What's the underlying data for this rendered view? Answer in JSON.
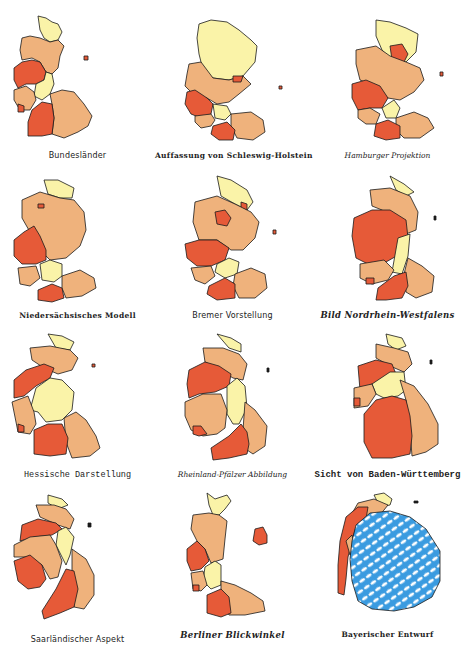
{
  "colors": {
    "light": "#faf3a8",
    "medium": "#efb27c",
    "dark": "#e65a38",
    "bavaria_blue": "#3a9be0",
    "outline": "#1a1a1a"
  },
  "panels": [
    {
      "caption": "Bundesländer",
      "style": "sans"
    },
    {
      "caption": "Auffassung von Schleswig-Holstein",
      "style": "fraktur"
    },
    {
      "caption": "Hamburger Projektion",
      "style": "script"
    },
    {
      "caption": "Niedersächsisches Modell",
      "style": "fraktur"
    },
    {
      "caption": "Bremer Vorstellung",
      "style": "sans"
    },
    {
      "caption": "Bild Nordrhein-Westfalens",
      "style": "italic"
    },
    {
      "caption": "Hessische Darstellung",
      "style": "mono"
    },
    {
      "caption": "Rheinland-Pfälzer Abbildung",
      "style": "script"
    },
    {
      "caption": "Sicht von Baden-Württemberg",
      "style": "mono-bold"
    },
    {
      "caption": "Saarländischer Aspekt",
      "style": "sans"
    },
    {
      "caption": "Berliner Blickwinkel",
      "style": "italic"
    },
    {
      "caption": "Bayerischer Entwurf",
      "style": "fraktur"
    }
  ]
}
